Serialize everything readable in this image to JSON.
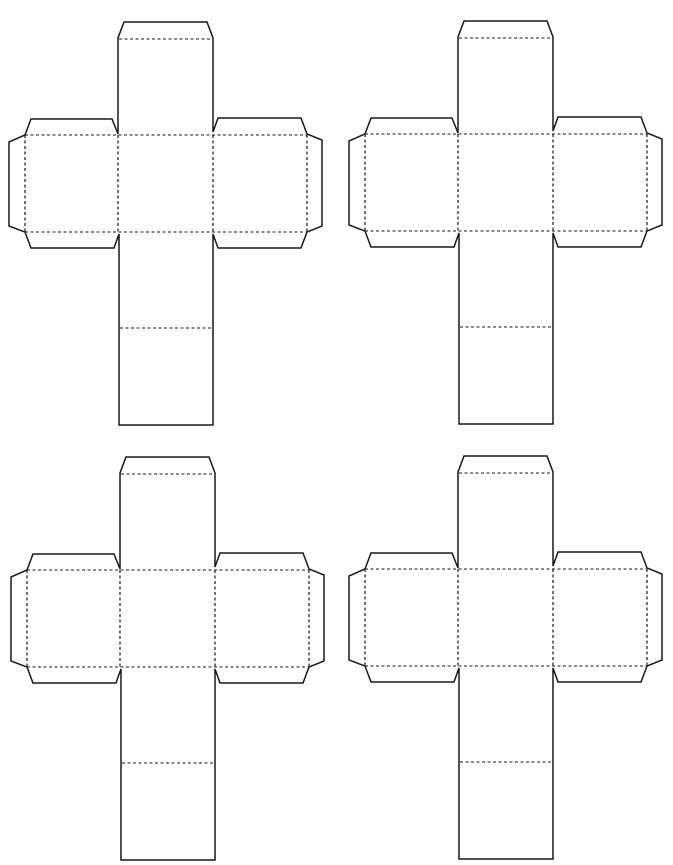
{
  "page": {
    "background": "#ffffff",
    "line_color": "#1a1a1a",
    "width": 673,
    "height": 865
  },
  "template": {
    "type": "cube-net",
    "count": 4,
    "line_styles": {
      "cut": "solid",
      "fold": "dashed"
    }
  },
  "nets": [
    {
      "id": "net-top-left",
      "dx": 0,
      "dy": 0
    },
    {
      "id": "net-top-right",
      "dx": 340,
      "dy": -1
    },
    {
      "id": "net-bottom-left",
      "dx": 2,
      "dy": 435
    },
    {
      "id": "net-bottom-right",
      "dx": 340,
      "dy": 434
    }
  ]
}
